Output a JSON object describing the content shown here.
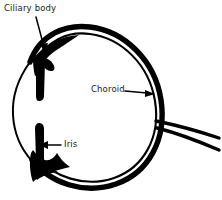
{
  "diagram": {
    "background_color": "#ffffff",
    "ink_color": "#000000",
    "labels": [
      {
        "id": "ciliary-body",
        "text": "Ciliary body",
        "position": {
          "x": 4,
          "y": 4
        },
        "leader": {
          "type": "arrow",
          "from": {
            "x": 36,
            "y": 16
          },
          "to": {
            "x": 45,
            "y": 52
          },
          "direction": "down-right"
        }
      },
      {
        "id": "choroid",
        "text": "Choroid",
        "position": {
          "x": 91,
          "y": 85
        },
        "leader": {
          "type": "arrow",
          "from": {
            "x": 125,
            "y": 91
          },
          "to": {
            "x": 155,
            "y": 94
          },
          "direction": "right"
        }
      },
      {
        "id": "iris",
        "text": "Iris",
        "position": {
          "x": 64,
          "y": 140
        },
        "leader": {
          "type": "arrow",
          "from": {
            "x": 61,
            "y": 145
          },
          "to": {
            "x": 40,
            "y": 145
          },
          "direction": "left"
        }
      }
    ],
    "structures": [
      {
        "id": "eyeball-outline",
        "name": "eyeball-outline",
        "shape": "circle",
        "center": {
          "x": 86,
          "y": 113
        },
        "radius": 76
      },
      {
        "id": "sclera-outer-wall",
        "name": "sclera-outer-wall",
        "shape": "arc",
        "description": "thick outer arc on upper, right and lower circumference"
      },
      {
        "id": "choroid-inner-wall",
        "name": "choroid-inner-wall",
        "shape": "arc",
        "description": "second thin arc just inside the sclera on right side"
      },
      {
        "id": "ciliary-body-mass",
        "name": "ciliary-body-mass",
        "shape": "filled-wedge",
        "description": "thick black wedge at upper-left of eyeball"
      },
      {
        "id": "iris-mass",
        "name": "iris-mass",
        "shape": "filled-wedge",
        "description": "thin vertical bar with thick wedge at lower-left of eyeball"
      },
      {
        "id": "cornea-arc",
        "name": "cornea-arc",
        "shape": "arc",
        "description": "thin single-line arc on far left between ciliary body and iris"
      },
      {
        "id": "optic-nerve",
        "name": "optic-nerve",
        "shape": "two-diverging-lines",
        "description": "two lines leaving the right side of the eyeball toward the right edge"
      }
    ]
  }
}
